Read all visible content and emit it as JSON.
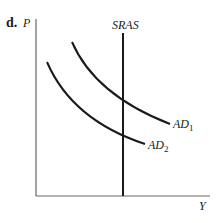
{
  "panel_label": "d.",
  "axes": {
    "y_label": "P",
    "x_label": "Y"
  },
  "curves": {
    "sras": {
      "label": "SRAS",
      "type": "vertical"
    },
    "ad1": {
      "label": "AD",
      "subscript": "1"
    },
    "ad2": {
      "label": "AD",
      "subscript": "2"
    }
  },
  "colors": {
    "axis": "#555555",
    "curve": "#1a1a1a",
    "text": "#1a1a1a",
    "background": "#ffffff"
  }
}
